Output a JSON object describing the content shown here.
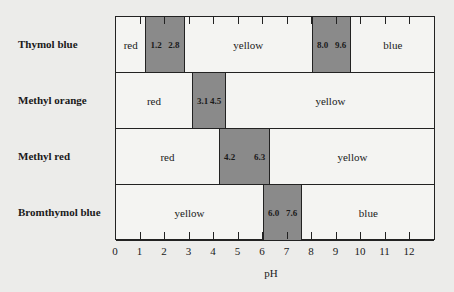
{
  "chart_data": {
    "type": "table",
    "title": "",
    "xlabel": "pH",
    "ylabel": "",
    "xlim": [
      0,
      13
    ],
    "x_ticks": [
      0,
      1,
      2,
      3,
      4,
      5,
      6,
      7,
      8,
      9,
      10,
      11,
      12
    ],
    "indicators": [
      {
        "name": "Thymol blue",
        "segments": [
          {
            "label": "red",
            "from": 0,
            "to": 1.2,
            "type": "color"
          },
          {
            "label": "",
            "from": 1.2,
            "to": 2.8,
            "type": "transition",
            "low": "1.2",
            "high": "2.8"
          },
          {
            "label": "yellow",
            "from": 2.8,
            "to": 8.0,
            "type": "color"
          },
          {
            "label": "",
            "from": 8.0,
            "to": 9.6,
            "type": "transition",
            "low": "8.0",
            "high": "9.6"
          },
          {
            "label": "blue",
            "from": 9.6,
            "to": 13,
            "type": "color"
          }
        ]
      },
      {
        "name": "Methyl orange",
        "segments": [
          {
            "label": "red",
            "from": 0,
            "to": 3.1,
            "type": "color"
          },
          {
            "label": "",
            "from": 3.1,
            "to": 4.5,
            "type": "transition",
            "low": "3.1",
            "high": "4.5"
          },
          {
            "label": "yellow",
            "from": 4.5,
            "to": 13,
            "type": "color"
          }
        ]
      },
      {
        "name": "Methyl red",
        "segments": [
          {
            "label": "red",
            "from": 0,
            "to": 4.2,
            "type": "color"
          },
          {
            "label": "",
            "from": 4.2,
            "to": 6.3,
            "type": "transition",
            "low": "4.2",
            "high": "6.3"
          },
          {
            "label": "yellow",
            "from": 6.3,
            "to": 13,
            "type": "color"
          }
        ]
      },
      {
        "name": "Bromthymol blue",
        "segments": [
          {
            "label": "yellow",
            "from": 0,
            "to": 6.0,
            "type": "color"
          },
          {
            "label": "",
            "from": 6.0,
            "to": 7.6,
            "type": "transition",
            "low": "6.0",
            "high": "7.6"
          },
          {
            "label": "blue",
            "from": 7.6,
            "to": 13,
            "type": "color"
          }
        ]
      }
    ],
    "grid": false,
    "legend": "none"
  }
}
